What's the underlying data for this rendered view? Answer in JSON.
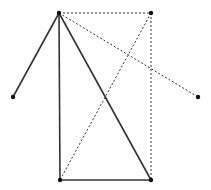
{
  "diagram": {
    "width": 211,
    "height": 190,
    "background": "#ffffff",
    "stroke_color": "#333333",
    "points": [
      {
        "id": "A",
        "x": 59,
        "y": 13
      },
      {
        "id": "B",
        "x": 151,
        "y": 13
      },
      {
        "id": "C",
        "x": 13,
        "y": 97
      },
      {
        "id": "D",
        "x": 198,
        "y": 97
      },
      {
        "id": "E",
        "x": 60,
        "y": 180
      },
      {
        "id": "F",
        "x": 151,
        "y": 180
      }
    ],
    "solid_segments": [
      [
        "A",
        "C"
      ],
      [
        "A",
        "E"
      ],
      [
        "A",
        "F"
      ],
      [
        "E",
        "F"
      ]
    ],
    "dashed_segments": [
      [
        "A",
        "B"
      ],
      [
        "B",
        "F"
      ],
      [
        "B",
        "E"
      ],
      [
        "A",
        "D"
      ]
    ]
  }
}
